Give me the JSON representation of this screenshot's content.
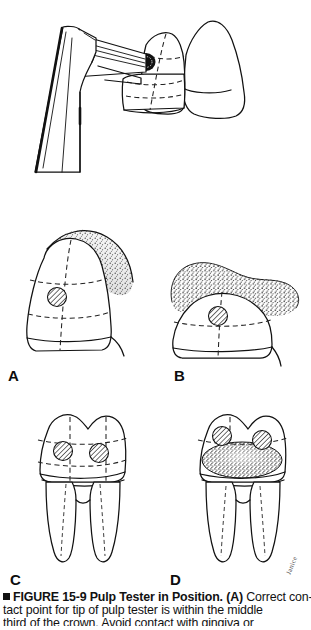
{
  "figure": {
    "number": "15-9",
    "label_prefix": "FIGURE",
    "title": "Pulp Tester in Position.",
    "caption_lines": [
      "FIGURE 15-9 Pulp Tester in Position. (A) Correct con-",
      "tact point for tip of pulp tester is within the middle",
      "third of the crown. Avoid contact with gingiva or"
    ],
    "caption_line1_bold": "FIGURE 15-9 Pulp Tester in Position. (A)",
    "caption_line1_rest": " Correct con-",
    "caption_line2": "tact point for tip of pulp tester is within the middle",
    "caption_line3": "third of the crown. Avoid contact with gingiva or",
    "bullet_marker": "square-bullet"
  },
  "panels": [
    {
      "id": "top",
      "label": "",
      "name": "pulp-tester-in-position-illustration",
      "description": "Pulp tester handpiece with electrode tip contacting middle third of an anterior tooth crown, adjacent tooth and stippled gingiva behind"
    },
    {
      "id": "A",
      "label": "A",
      "name": "panel-a-correct-contact-point",
      "description": "Single anterior tooth divided by dashed lines into thirds with hatched circle marking correct electrode contact in middle third; stippled gingiva along cervical margin"
    },
    {
      "id": "B",
      "label": "B",
      "name": "panel-b-gingival-contact",
      "description": "Tooth with heavy stippled overgrown gingiva covering crown; hatched contact circle near gingival margin"
    },
    {
      "id": "C",
      "label": "C",
      "name": "panel-c-molar-correct-contact",
      "description": "Two-rooted molar divided by dashed lines into thirds with two hatched contact circles in middle third"
    },
    {
      "id": "D",
      "label": "D",
      "name": "panel-d-molar-with-restoration",
      "description": "Two-rooted molar with large stippled metallic restoration; two hatched contact circles above restoration"
    }
  ],
  "artist_signature": "Janice",
  "colors": {
    "ink": "#111111",
    "background": "#ffffff",
    "dashed_guide": "#222222",
    "stipple": "#3a3a3a"
  }
}
